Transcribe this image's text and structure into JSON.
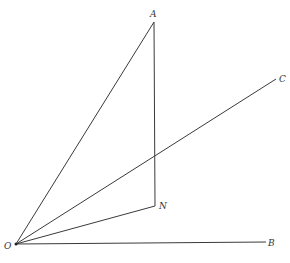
{
  "diagram": {
    "points": {
      "O": {
        "label": "O",
        "x": 16,
        "y": 244
      },
      "A": {
        "label": "A",
        "x": 154,
        "y": 22
      },
      "N": {
        "label": "N",
        "x": 155,
        "y": 206
      },
      "B": {
        "label": "B",
        "x": 266,
        "y": 242
      },
      "C": {
        "label": "C",
        "x": 276,
        "y": 79
      }
    },
    "segments": [
      "OA",
      "AN",
      "ON",
      "OC",
      "OB"
    ],
    "colors": {
      "line": "#3a3a3a",
      "label": "#333333",
      "background": "#ffffff"
    }
  }
}
